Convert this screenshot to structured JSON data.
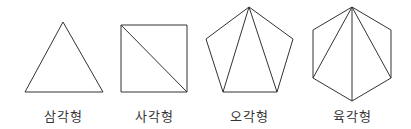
{
  "diagram": {
    "title": "",
    "stroke_color": "#333333",
    "shapes": [
      {
        "id": "triangle",
        "label": "삼각형",
        "sides": 3,
        "label_x": 63,
        "outline": "63,22 103,92 25,92",
        "diagonals": []
      },
      {
        "id": "square",
        "label": "사각형",
        "sides": 4,
        "label_x": 154,
        "outline": "121,25 187,25 187,92 121,92",
        "diagonals": [
          [
            121,
            25,
            187,
            92
          ]
        ]
      },
      {
        "id": "pentagon",
        "label": "오각형",
        "sides": 5,
        "label_x": 249,
        "outline": "249,7 293,39 277,92 223,92 206,39",
        "diagonals": [
          [
            249,
            7,
            223,
            92
          ],
          [
            249,
            7,
            277,
            92
          ]
        ]
      },
      {
        "id": "hexagon",
        "label": "육각형",
        "sides": 6,
        "label_x": 352,
        "outline": "352,7 391,30 391,78 352,101 313,78 313,30",
        "diagonals": [
          [
            352,
            7,
            313,
            78
          ],
          [
            352,
            7,
            352,
            101
          ],
          [
            352,
            7,
            391,
            78
          ]
        ]
      }
    ]
  }
}
